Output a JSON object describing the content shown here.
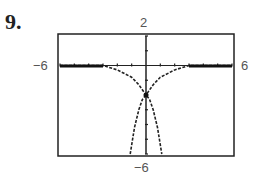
{
  "problem": {
    "number": "9."
  },
  "window": {
    "xmin_label": "−6",
    "xmax_label": "6",
    "ymax_label": "2",
    "ymin_label": "−6"
  },
  "chart_data": {
    "type": "line",
    "title": "",
    "xlabel": "",
    "ylabel": "",
    "xlim": [
      -6,
      6
    ],
    "ylim": [
      -6,
      2
    ],
    "tick_labels": {
      "xmin": "−6",
      "xmax": "6",
      "ymax": "2",
      "ymin": "−6"
    },
    "x_tick_step": 1,
    "y_tick_step": 1,
    "grid": false,
    "legend": null,
    "series": [
      {
        "name": "curve-1 (cusp shape, approaches y=0)",
        "style": "dashed",
        "points": [
          [
            -6,
            0
          ],
          [
            -3,
            0
          ],
          [
            -2,
            -0.3
          ],
          [
            -1,
            -0.8
          ],
          [
            -0.5,
            -1.3
          ],
          [
            0,
            -2
          ],
          [
            0.5,
            -1.3
          ],
          [
            1,
            -0.8
          ],
          [
            2,
            -0.3
          ],
          [
            3,
            0
          ],
          [
            6,
            0
          ]
        ]
      },
      {
        "name": "curve-2 (downward opening, through (0,-2))",
        "style": "dashed",
        "points": [
          [
            -1.1,
            -6
          ],
          [
            -0.8,
            -4.2
          ],
          [
            -0.5,
            -3
          ],
          [
            -0.25,
            -2.3
          ],
          [
            0,
            -2
          ],
          [
            0.25,
            -2.3
          ],
          [
            0.5,
            -3
          ],
          [
            0.8,
            -4.2
          ],
          [
            1.1,
            -6
          ]
        ]
      }
    ]
  }
}
